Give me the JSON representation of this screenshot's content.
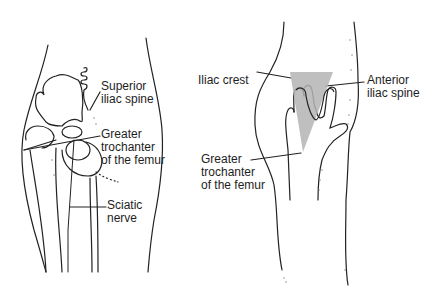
{
  "figure": {
    "left_panel": {
      "title": "Posterior hip anatomy",
      "labels": [
        {
          "id": "superior-iliac-spine",
          "lines": [
            "Superior",
            "iliac spine"
          ]
        },
        {
          "id": "greater-trochanter",
          "lines": [
            "Greater",
            "trochanter",
            "of the femur"
          ]
        },
        {
          "id": "sciatic-nerve",
          "lines": [
            "Sciatic",
            "nerve"
          ]
        }
      ]
    },
    "right_panel": {
      "title": "Hand placement landmarks",
      "labels": [
        {
          "id": "iliac-crest",
          "lines": [
            "Iliac crest"
          ]
        },
        {
          "id": "anterior-iliac-spine",
          "lines": [
            "Anterior",
            "iliac spine"
          ]
        },
        {
          "id": "greater-trochanter",
          "lines": [
            "Greater",
            "trochanter",
            "of the femur"
          ]
        }
      ],
      "triangle_color": "#b4b4b4"
    }
  }
}
